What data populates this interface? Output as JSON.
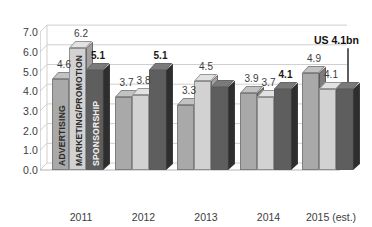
{
  "chart_data": {
    "type": "bar",
    "title": "",
    "subtitle": "",
    "xlabel": "",
    "ylabel": "",
    "categories": [
      "2011",
      "2012",
      "2013",
      "2014",
      "2015 (est.)"
    ],
    "ylim": [
      0,
      7
    ],
    "ytick_values": [
      0,
      1,
      2,
      3,
      4,
      5,
      6,
      7
    ],
    "ytick_labels": [
      "0.0",
      "1.0",
      "2.0",
      "3.0",
      "4.0",
      "5.0",
      "6.0",
      "7.0"
    ],
    "grid": true,
    "legend_position": "in-bar-vertical-labels",
    "threed": true,
    "series": [
      {
        "name": "ADVERTISING",
        "color": "#a9a9a9",
        "values": [
          4.6,
          3.7,
          3.3,
          3.9,
          4.9
        ],
        "labels": [
          "4.6",
          "3.7",
          "3.3",
          "3.9",
          "4.9"
        ],
        "label_bold": [
          false,
          false,
          false,
          false,
          false
        ]
      },
      {
        "name": "MARKETING/PROMOTION",
        "color": "#d2d2d2",
        "values": [
          6.2,
          3.8,
          4.5,
          3.7,
          4.1
        ],
        "labels": [
          "6.2",
          "3.8",
          "4.5",
          "3.7",
          "4.1"
        ],
        "label_bold": [
          false,
          false,
          false,
          false,
          false
        ]
      },
      {
        "name": "SPONSORSHIP",
        "color": "#5e5e5e",
        "values": [
          5.1,
          5.1,
          4.2,
          4.1,
          4.1
        ],
        "labels": [
          "5.1",
          "5.1",
          "",
          "4.1",
          ""
        ],
        "label_bold": [
          true,
          true,
          false,
          true,
          false
        ]
      }
    ],
    "annotations": [
      {
        "text": "US 4.1bn",
        "target_series": "SPONSORSHIP",
        "target_category": "2015 (est.)"
      }
    ]
  }
}
